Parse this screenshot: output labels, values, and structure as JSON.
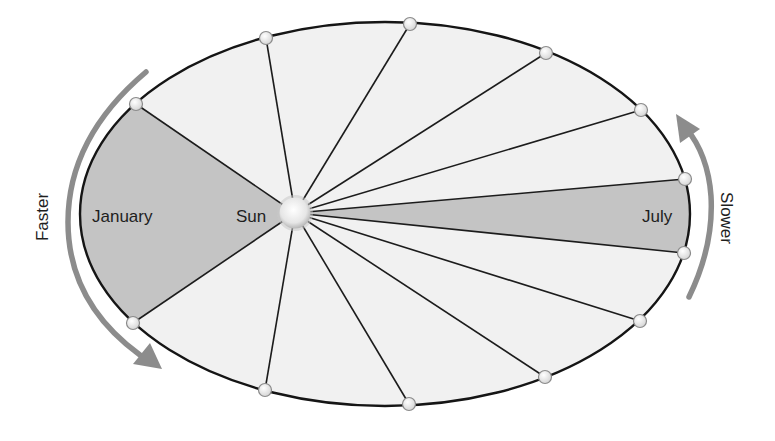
{
  "labels": {
    "january": "January",
    "sun": "Sun",
    "july": "July",
    "faster": "Faster",
    "slower": "Slower"
  },
  "colors": {
    "orbit_fill": "#f1f1f1",
    "sector_fill": "#c4c4c4",
    "orbit_stroke": "#151515",
    "arrow": "#8c8c8c",
    "marker_fill": "#f4f4f4",
    "sun_fill": "#ececec"
  },
  "orbit": {
    "cx": 385,
    "cy": 214,
    "rx": 305,
    "ry": 192
  },
  "sun": {
    "x": 295,
    "y": 213,
    "r": 17
  },
  "positions": [
    {
      "x": 136,
      "y": 104
    },
    {
      "x": 266,
      "y": 38
    },
    {
      "x": 410,
      "y": 24
    },
    {
      "x": 546,
      "y": 53
    },
    {
      "x": 641,
      "y": 110
    },
    {
      "x": 685,
      "y": 179
    },
    {
      "x": 684,
      "y": 253
    },
    {
      "x": 640,
      "y": 321
    },
    {
      "x": 545,
      "y": 377
    },
    {
      "x": 409,
      "y": 404
    },
    {
      "x": 265,
      "y": 390
    },
    {
      "x": 133,
      "y": 323
    }
  ],
  "shaded_sectors": [
    {
      "name": "january",
      "from": 11,
      "to": 0
    },
    {
      "name": "july",
      "from": 5,
      "to": 6
    }
  ]
}
